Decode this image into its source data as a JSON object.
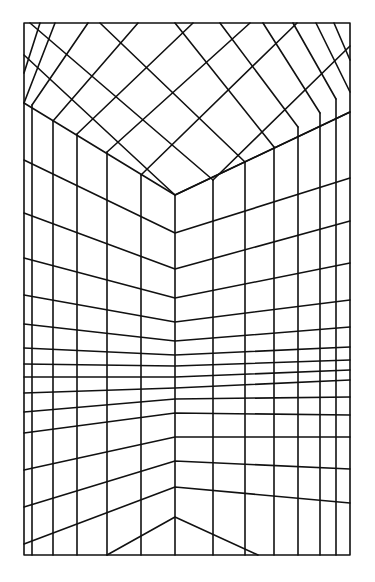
{
  "drawing": {
    "subject": "perspective grid of a room corner (ceiling and two walls)",
    "stroke_color": "#111111",
    "background_color": "#ffffff",
    "frame": {
      "x1": 24,
      "y1": 23,
      "x2": 350,
      "y2": 555
    },
    "corner_x": 175,
    "ceiling_corner": {
      "x": 175,
      "y": 195
    },
    "wall_verticals": [
      {
        "x": 32,
        "top": 105
      },
      {
        "x": 53,
        "top": 121
      },
      {
        "x": 77,
        "top": 134
      },
      {
        "x": 107,
        "top": 152
      },
      {
        "x": 141,
        "top": 175
      },
      {
        "x": 175,
        "top": 195
      },
      {
        "x": 213,
        "top": 180
      },
      {
        "x": 245,
        "top": 162
      },
      {
        "x": 274,
        "top": 147
      },
      {
        "x": 298,
        "top": 127
      },
      {
        "x": 320,
        "top": 113
      },
      {
        "x": 336,
        "top": 99
      }
    ],
    "wall_horizontals": [
      [
        103,
        195,
        112
      ],
      [
        160,
        233,
        178
      ],
      [
        213,
        269,
        221
      ],
      [
        258,
        298,
        263
      ],
      [
        295,
        322,
        300
      ],
      [
        324,
        341,
        327
      ],
      [
        348,
        355,
        347
      ],
      [
        364,
        366,
        360
      ],
      [
        377,
        377,
        370
      ],
      [
        393,
        388,
        380
      ],
      [
        412,
        399,
        397
      ],
      [
        433,
        413,
        415
      ],
      [
        470,
        437,
        437
      ],
      [
        507,
        461,
        469
      ],
      [
        544,
        487,
        503
      ],
      [
        null,
        517,
        543
      ]
    ],
    "floor_v": {
      "left_x": 107,
      "apex_y": 517,
      "right_x": 258
    },
    "ceiling_lines": [
      [
        [
          24,
          55
        ],
        [
          175,
          195
        ]
      ],
      [
        [
          24,
          103
        ],
        [
          55,
          23
        ]
      ],
      [
        [
          24,
          73
        ],
        [
          40,
          23
        ]
      ],
      [
        [
          32,
          105
        ],
        [
          88,
          23
        ]
      ],
      [
        [
          53,
          121
        ],
        [
          138,
          23
        ]
      ],
      [
        [
          77,
          134
        ],
        [
          193,
          23
        ]
      ],
      [
        [
          107,
          152
        ],
        [
          250,
          23
        ]
      ],
      [
        [
          141,
          175
        ],
        [
          297,
          23
        ]
      ],
      [
        [
          24,
          33
        ],
        [
          24,
          33
        ]
      ],
      [
        [
          30,
          23
        ],
        [
          213,
          180
        ]
      ],
      [
        [
          100,
          23
        ],
        [
          245,
          162
        ]
      ],
      [
        [
          175,
          23
        ],
        [
          274,
          147
        ]
      ],
      [
        [
          220,
          23
        ],
        [
          298,
          127
        ]
      ],
      [
        [
          263,
          23
        ],
        [
          320,
          113
        ]
      ],
      [
        [
          293,
          23
        ],
        [
          336,
          99
        ]
      ],
      [
        [
          316,
          23
        ],
        [
          350,
          92
        ]
      ],
      [
        [
          334,
          23
        ],
        [
          350,
          60
        ]
      ],
      [
        [
          175,
          195
        ],
        [
          350,
          112
        ]
      ],
      [
        [
          213,
          180
        ],
        [
          350,
          46
        ]
      ]
    ]
  }
}
